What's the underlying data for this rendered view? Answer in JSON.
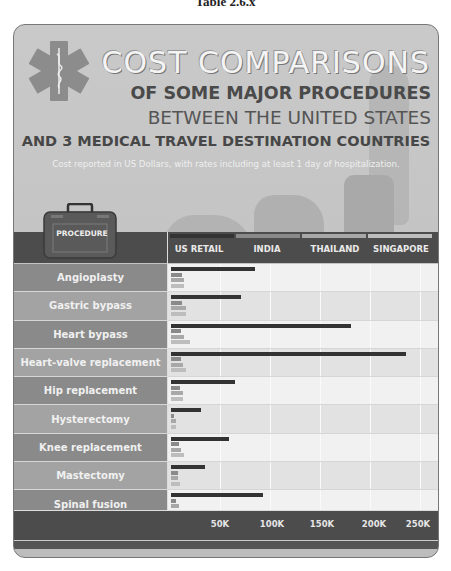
{
  "caption": "Table 2.6.x",
  "title": {
    "line1": "COST COMPARISONS",
    "line2": "OF SOME MAJOR PROCEDURES",
    "line3": "BETWEEN THE UNITED STATES",
    "line4": "AND 3 MEDICAL TRAVEL DESTINATION COUNTRIES",
    "subtitle": "Cost reported in US Dollars, with rates including at least 1 day of hospitalization."
  },
  "header": {
    "procedure_label": "PROCEDURE"
  },
  "legend": [
    {
      "name": "US RETAIL",
      "color": "#333333"
    },
    {
      "name": "INDIA",
      "color": "#8a8a8a"
    },
    {
      "name": "THAILAND",
      "color": "#a8a8a8"
    },
    {
      "name": "SINGAPORE",
      "color": "#bdbdbd"
    }
  ],
  "axis": {
    "ticks": [
      "50K",
      "100K",
      "150K",
      "200K",
      "250K"
    ]
  },
  "chart_data": {
    "type": "bar",
    "orientation": "horizontal",
    "title": "Cost Comparisons of Some Major Procedures Between the United States and 3 Medical Travel Destination Countries",
    "subtitle": "Cost reported in US Dollars, with rates including at least 1 day of hospitalization.",
    "xlabel": "Cost (USD)",
    "ylabel": "Procedure",
    "xlim": [
      0,
      260000
    ],
    "x_ticks": [
      "50K",
      "100K",
      "150K",
      "200K",
      "250K"
    ],
    "legend_position": "top",
    "categories": [
      "Angioplasty",
      "Gastric bypass",
      "Heart bypass",
      "Heart-valve replacement",
      "Hip replacement",
      "Hysterectomy",
      "Knee replacement",
      "Mastectomy",
      "Spinal fusion"
    ],
    "series": [
      {
        "name": "US RETAIL",
        "values": [
          84000,
          70000,
          180000,
          235000,
          64000,
          30000,
          58000,
          34000,
          92000
        ]
      },
      {
        "name": "INDIA",
        "values": [
          11000,
          11000,
          10000,
          10000,
          9000,
          3000,
          8000,
          7000,
          5000
        ]
      },
      {
        "name": "THAILAND",
        "values": [
          13000,
          15000,
          13000,
          12000,
          12000,
          5000,
          10000,
          7000,
          8000
        ]
      },
      {
        "name": "SINGAPORE",
        "values": [
          13000,
          15000,
          19000,
          15000,
          12000,
          5000,
          13000,
          9000,
          9000
        ]
      }
    ]
  }
}
